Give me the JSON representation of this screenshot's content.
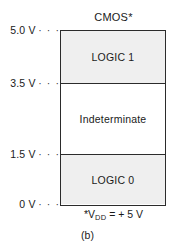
{
  "figure": {
    "title": "CMOS*",
    "caption": "(b)",
    "footnote": {
      "prefix": "*V",
      "subscript": "DD",
      "suffix": " = + 5 V",
      "full_text": "*VDD = + 5 V"
    }
  },
  "axis": {
    "unit": "V",
    "leader_dots": "· · ·",
    "ticks": [
      {
        "label": "5.0 V",
        "value": 5.0
      },
      {
        "label": "3.5 V",
        "value": 3.5
      },
      {
        "label": "1.5 V",
        "value": 1.5
      },
      {
        "label": "0 V",
        "value": 0
      }
    ]
  },
  "bands": [
    {
      "label": "LOGIC 1",
      "from": 3.5,
      "to": 5.0,
      "shaded": true
    },
    {
      "label": "Indeterminate",
      "from": 1.5,
      "to": 3.5,
      "shaded": false
    },
    {
      "label": "LOGIC 0",
      "from": 0.0,
      "to": 1.5,
      "shaded": true
    }
  ],
  "colors": {
    "band_shaded": "#efefef",
    "band_clear": "#ffffff",
    "stroke": "#2b2b2b",
    "text": "#1a1a1a",
    "background": "#ffffff"
  },
  "chart_data": {
    "type": "bar",
    "title": "CMOS*",
    "xlabel": "",
    "ylabel": "",
    "ylim": [
      0,
      5.0
    ],
    "grid": false,
    "legend": "none",
    "categories": [
      "LOGIC 0",
      "Indeterminate",
      "LOGIC 1"
    ],
    "series": [
      {
        "name": "Voltage range (V)",
        "ranges": [
          {
            "label": "LOGIC 0",
            "min": 0.0,
            "max": 1.5
          },
          {
            "label": "Indeterminate",
            "min": 1.5,
            "max": 3.5
          },
          {
            "label": "LOGIC 1",
            "min": 3.5,
            "max": 5.0
          }
        ]
      }
    ],
    "ytick_labels": [
      "0 V",
      "1.5 V",
      "3.5 V",
      "5.0 V"
    ],
    "ytick_values": [
      0,
      1.5,
      3.5,
      5.0
    ],
    "annotations": [
      "*VDD = + 5 V",
      "(b)"
    ]
  }
}
